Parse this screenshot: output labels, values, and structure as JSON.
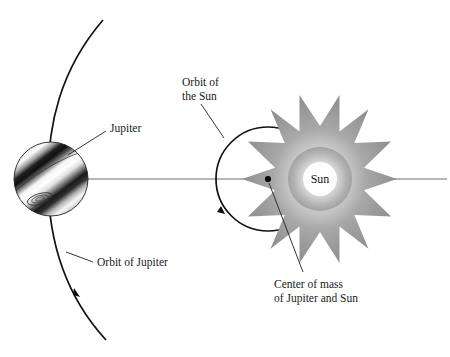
{
  "figure": {
    "background_color": "#ffffff",
    "width": 450,
    "height": 357
  },
  "labels": {
    "jupiter": "Jupiter",
    "orbit_of_jupiter": "Orbit of Jupiter",
    "orbit_of_the_sun_line1": "Orbit of",
    "orbit_of_the_sun_line2": "the Sun",
    "sun": "Sun",
    "center_of_mass_line1": "Center of mass",
    "center_of_mass_line2": "of Jupiter and Sun"
  },
  "icons": {
    "jupiter_planet": "jupiter-planet-icon",
    "great_red_spot": "great-red-spot-icon",
    "sun_starburst": "sun-starburst-icon",
    "barycenter_dot": "center-of-mass-dot-icon",
    "orbit_direction_arrow": "orbit-direction-arrow-icon"
  },
  "colors": {
    "background": "#ffffff",
    "ink": "#111111",
    "text": "#1a1a1a",
    "axis_line": "#6e6e6e",
    "sun_core": "#ffffff",
    "sun_mid": "#c9c9c9",
    "sun_ray": "#9a9a9a",
    "planet_light_band": "#f2f2f2",
    "planet_dark_band": "#1c1c1c"
  },
  "geometry": {
    "axis_y": 179,
    "axis_x_start": 60,
    "axis_x_end": 447,
    "jupiter_center_x": 51,
    "jupiter_center_y": 179,
    "jupiter_radius": 37,
    "barycenter_x": 268,
    "barycenter_y": 179,
    "sun_orbit_radius": 52,
    "sun_center_x": 320,
    "sun_center_y": 179,
    "sun_outer_radius": 63,
    "sun_inner_radius": 27,
    "sun_ray_count": 16,
    "jupiter_orbit_top": [
      103,
      20
    ],
    "jupiter_orbit_bottom": [
      106,
      340
    ]
  },
  "annotations": [
    {
      "name": "jupiter",
      "text": "Jupiter",
      "text_x": 110,
      "text_y": 129,
      "leader": "M106,131 L68,155"
    },
    {
      "name": "orbit-of-jupiter",
      "text": "Orbit of Jupiter",
      "text_x": 96,
      "text_y": 266,
      "leader": "M93,262 L66,252"
    },
    {
      "name": "orbit-of-the-sun",
      "text": "Orbit of the Sun",
      "text_x": 182,
      "text_y": 86,
      "leader": "M200,106 L222,136"
    },
    {
      "name": "center-of-mass",
      "text": "Center of mass of Jupiter and Sun",
      "text_x": 274,
      "text_y": 287,
      "leader": "M268,182 L302,272"
    }
  ]
}
